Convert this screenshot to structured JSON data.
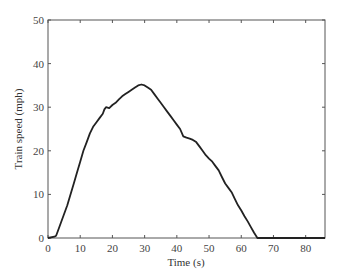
{
  "chart_data": {
    "type": "line",
    "title": "",
    "xlabel": "Time (s)",
    "ylabel": "Train speed (mph)",
    "xlim": [
      0,
      86
    ],
    "ylim": [
      0,
      50
    ],
    "xticks": [
      0,
      10,
      20,
      30,
      40,
      50,
      60,
      70,
      80
    ],
    "yticks": [
      0,
      10,
      20,
      30,
      40,
      50
    ],
    "grid": false,
    "legend": null,
    "series": [
      {
        "name": "Train speed",
        "color": "#222222",
        "x": [
          0,
          2,
          2.5,
          3,
          4,
          5,
          6,
          7,
          8,
          9,
          10,
          11,
          12,
          13,
          14,
          15,
          16,
          17,
          17.5,
          18,
          19,
          20,
          21,
          22,
          23,
          24,
          25,
          26,
          27,
          28,
          29,
          30,
          31,
          32,
          33,
          34,
          35,
          36,
          37,
          38,
          39,
          40,
          41,
          42,
          43,
          44,
          45,
          46,
          47,
          48,
          49,
          50,
          51,
          52,
          53,
          54,
          55,
          56,
          57,
          58,
          59,
          60,
          61,
          62,
          63,
          64,
          65,
          66,
          67,
          68,
          70,
          75,
          80,
          86
        ],
        "y": [
          0,
          0.3,
          0.5,
          1.5,
          3.5,
          5.5,
          7.5,
          10,
          12.5,
          15,
          17.5,
          20,
          22,
          24,
          25.5,
          26.5,
          27.5,
          28.5,
          29.5,
          30,
          29.8,
          30.5,
          31,
          31.8,
          32.5,
          33,
          33.5,
          34,
          34.5,
          35,
          35.2,
          35,
          34.5,
          34,
          33,
          32,
          31,
          30,
          29,
          28,
          27,
          26,
          25,
          23.3,
          23,
          22.8,
          22.5,
          22,
          21,
          20,
          19,
          18.2,
          17.5,
          16.5,
          15.5,
          14,
          12.5,
          11.5,
          10.5,
          9,
          7.5,
          6.3,
          5,
          3.8,
          2.5,
          1.2,
          0,
          0,
          0,
          0,
          0,
          0,
          0,
          0
        ]
      }
    ]
  }
}
